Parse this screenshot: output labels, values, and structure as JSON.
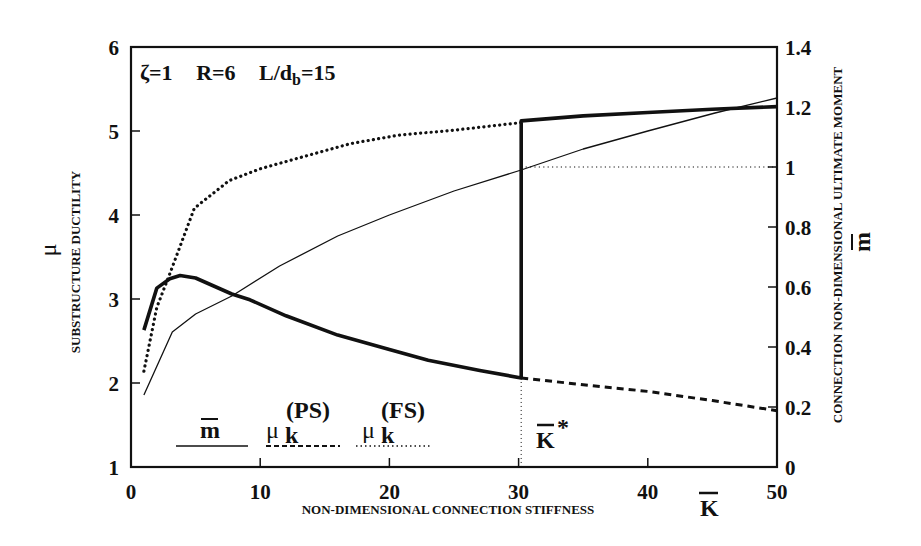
{
  "chart_data": {
    "type": "line",
    "title": "",
    "annotation": {
      "zeta": "ζ=1",
      "R": "R=6",
      "L_over_db": "L/d",
      "L_sub": "b",
      "L_val": "=15"
    },
    "xlabel": "NON-DIMENSIONAL CONNECTION STIFFNESS",
    "xsymbol": "K",
    "ylabel_left": "SUBSTRUCTURE DUCTILITY",
    "ysymbol_left": "μ",
    "ylabel_right": "CONNECTION NON-DIMENSIONAL ULTIMATE MOMENT",
    "ysymbol_right": "m",
    "xlim": [
      0,
      50
    ],
    "ylim_left": [
      1,
      6
    ],
    "ylim_right": [
      0,
      1.4
    ],
    "xticks": [
      "0",
      "10",
      "20",
      "30",
      "40",
      "50"
    ],
    "yticks_left": [
      "1",
      "2",
      "3",
      "4",
      "5",
      "6"
    ],
    "yticks_right": [
      "0",
      "0.2",
      "0.4",
      "0.6",
      "0.8",
      "1",
      "1.2",
      "1.4"
    ],
    "grid": false,
    "k_star": {
      "label": "K",
      "sup": "*",
      "value": 30.2
    },
    "legend": [
      {
        "label": "m",
        "sup": "",
        "sub": "",
        "style": "thin-solid"
      },
      {
        "label": "μ",
        "sub": "k",
        "sup": "(PS)",
        "style": "dashed"
      },
      {
        "label": "μ",
        "sub": "k",
        "sup": "(FS)",
        "style": "dotted"
      }
    ],
    "series": [
      {
        "name": "substructure ductility μ (envelope)",
        "axis": "left",
        "style": "thick-solid",
        "x": [
          1,
          2,
          3,
          3.8,
          5,
          7.8,
          9.2,
          12,
          16,
          20,
          23,
          27,
          30.2,
          30.2,
          35,
          40,
          45,
          50
        ],
        "y": [
          2.63,
          3.13,
          3.24,
          3.28,
          3.25,
          3.06,
          2.99,
          2.8,
          2.57,
          2.4,
          2.27,
          2.15,
          2.06,
          5.12,
          5.18,
          5.22,
          5.26,
          5.29
        ]
      },
      {
        "name": "μk(FS)",
        "axis": "left",
        "style": "dotted",
        "x": [
          1,
          2,
          3,
          4.9,
          7.6,
          10,
          13,
          17,
          20.7,
          25,
          30.2
        ],
        "y": [
          2.14,
          2.9,
          3.3,
          4.08,
          4.41,
          4.55,
          4.68,
          4.85,
          4.95,
          5.01,
          5.1
        ]
      },
      {
        "name": "μk(PS)",
        "axis": "left",
        "style": "dashed",
        "x": [
          30.2,
          35,
          40,
          45,
          50
        ],
        "y": [
          2.06,
          1.98,
          1.9,
          1.79,
          1.67
        ]
      },
      {
        "name": "m (ultimate moment)",
        "axis": "right",
        "style": "thin-solid",
        "x": [
          1,
          3.2,
          5,
          7.8,
          11.5,
          16,
          20,
          25,
          30.2,
          35,
          40,
          45.2,
          50
        ],
        "y": [
          0.24,
          0.45,
          0.51,
          0.57,
          0.67,
          0.77,
          0.84,
          0.92,
          0.99,
          1.06,
          1.12,
          1.18,
          1.23
        ]
      },
      {
        "name": "m = 1 reference",
        "axis": "right",
        "style": "fine-dotted",
        "x": [
          30.2,
          50
        ],
        "y": [
          1.0,
          1.0
        ]
      }
    ]
  },
  "colors": {
    "ink": "#111111",
    "background": "#ffffff"
  }
}
